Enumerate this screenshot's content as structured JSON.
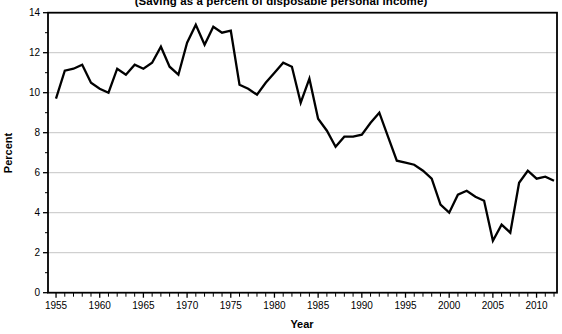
{
  "title": {
    "clipped_line": "(Saving as a percent of disposable personal income)"
  },
  "chart_data": {
    "type": "line",
    "title": "(Saving as a percent of disposable personal income)",
    "xlabel": "Year",
    "ylabel": "Percent",
    "xlim": [
      1954.08,
      2012.34
    ],
    "ylim": [
      0,
      14
    ],
    "yticks": [
      0,
      2,
      4,
      6,
      8,
      10,
      12,
      14
    ],
    "yticks_minor": [
      1,
      3,
      5,
      7,
      9,
      11,
      13
    ],
    "ygrid": [
      2,
      4,
      6,
      8,
      10,
      12
    ],
    "xticks": [
      1955,
      1960,
      1965,
      1970,
      1975,
      1980,
      1985,
      1990,
      1995,
      2000,
      2005,
      2010
    ],
    "grid": "horizontal-on",
    "legend": "none",
    "line_color": "#000000",
    "grid_color": "#c6c6c6",
    "frame_color": "#000000",
    "x": [
      1955,
      1956,
      1957,
      1958,
      1959,
      1960,
      1961,
      1962,
      1963,
      1964,
      1965,
      1966,
      1967,
      1968,
      1969,
      1970,
      1971,
      1972,
      1973,
      1974,
      1975,
      1976,
      1977,
      1978,
      1979,
      1980,
      1981,
      1982,
      1983,
      1984,
      1985,
      1986,
      1987,
      1988,
      1989,
      1990,
      1991,
      1992,
      1993,
      1994,
      1995,
      1996,
      1997,
      1998,
      1999,
      2000,
      2001,
      2002,
      2003,
      2004,
      2005,
      2006,
      2007,
      2008,
      2009,
      2010,
      2011,
      2012
    ],
    "values": [
      9.7,
      11.1,
      11.2,
      11.4,
      10.5,
      10.2,
      10.0,
      11.2,
      10.9,
      11.4,
      11.2,
      11.5,
      12.3,
      11.3,
      10.9,
      12.5,
      13.4,
      12.4,
      13.3,
      13.0,
      13.1,
      10.4,
      10.2,
      9.9,
      10.5,
      11.0,
      11.5,
      11.3,
      9.5,
      10.7,
      8.7,
      8.1,
      7.3,
      7.8,
      7.8,
      7.9,
      8.5,
      9.0,
      7.8,
      6.6,
      6.5,
      6.4,
      6.1,
      5.7,
      4.4,
      4.0,
      4.9,
      5.1,
      4.8,
      4.6,
      2.6,
      3.4,
      3.0,
      5.5,
      6.1,
      5.7,
      5.8,
      5.6
    ]
  }
}
